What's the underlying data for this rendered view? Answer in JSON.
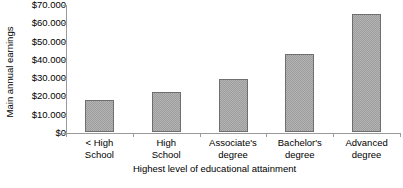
{
  "chart_data": {
    "type": "bar",
    "title": "",
    "xlabel": "Highest level of educational attainment",
    "ylabel": "Main annual earnings",
    "categories": [
      "< High School",
      "High School",
      "Associate's degree",
      "Bachelor's degree",
      "Advanced degree"
    ],
    "category_lines": [
      [
        "< High",
        "School"
      ],
      [
        "High",
        "School"
      ],
      [
        "Associate's",
        "degree"
      ],
      [
        "Bachelor's",
        "degree"
      ],
      [
        "Advanced",
        "degree"
      ]
    ],
    "values": [
      17500,
      22000,
      29000,
      42500,
      64500
    ],
    "ylim": [
      0,
      70000
    ],
    "ytick_values": [
      70000,
      60000,
      50000,
      40000,
      30000,
      20000,
      10000,
      0
    ],
    "ytick_labels": [
      "$70.000",
      "$60.000",
      "$50.000",
      "$40.000",
      "$30.000",
      "$20.000",
      "$10.000",
      "$0"
    ],
    "grid": false,
    "legend": null,
    "bar_fill_color": "#b4b4b4",
    "bar_edge_color": "#6f6f6f",
    "axis_color": "#9a9a9a"
  },
  "footer": {
    "clipped_text": ""
  }
}
